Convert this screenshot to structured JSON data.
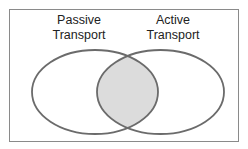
{
  "diagram": {
    "type": "venn",
    "sets": [
      {
        "id": "passive",
        "label_line1": "Passive",
        "label_line2": "Transport"
      },
      {
        "id": "active",
        "label_line1": "Active",
        "label_line2": "Transport"
      }
    ],
    "intersection": {
      "shaded": true,
      "fill": "#dcdcdc"
    },
    "colors": {
      "stroke": "#6b6b6b",
      "border": "#8a8a8a",
      "background": "#ffffff"
    }
  }
}
